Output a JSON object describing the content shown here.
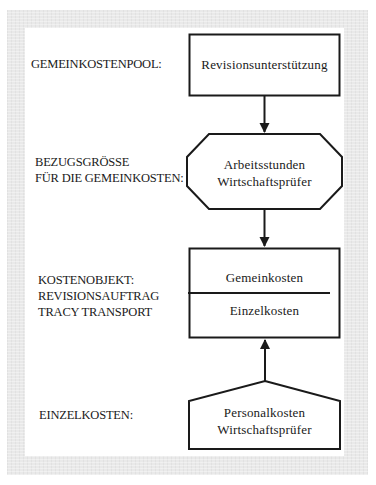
{
  "diagram": {
    "labels": {
      "pool": "GEMEINKOSTENPOOL:",
      "base_line1": "BEZUGSGRÖSSE",
      "base_line2": "FÜR DIE GEMEINKOSTEN:",
      "object_line1": "KOSTENOBJEKT:",
      "object_line2": "REVISIONSAUFTRAG",
      "object_line3": "TRACY TRANSPORT",
      "direct": "EINZELKOSTEN:"
    },
    "nodes": {
      "pool_box": {
        "shape": "rectangle",
        "text": "Revisionsunterstützung"
      },
      "base_octagon": {
        "shape": "octagon",
        "line1": "Arbeitsstunden",
        "line2": "Wirtschaftsprüfer"
      },
      "object_box": {
        "shape": "rectangle-divided",
        "top_text": "Gemeinkosten",
        "bottom_text": "Einzelkosten"
      },
      "direct_pentagon": {
        "shape": "pentagon",
        "line1": "Personalkosten",
        "line2": "Wirtschaftsprüfer"
      }
    },
    "edges": [
      {
        "from": "pool_box",
        "to": "base_octagon",
        "direction": "down"
      },
      {
        "from": "base_octagon",
        "to": "object_box",
        "direction": "down"
      },
      {
        "from": "direct_pentagon",
        "to": "object_box",
        "direction": "up"
      }
    ],
    "colors": {
      "frame": "#e9e9e9",
      "background": "#ffffff",
      "stroke": "#1a1a1a"
    }
  }
}
